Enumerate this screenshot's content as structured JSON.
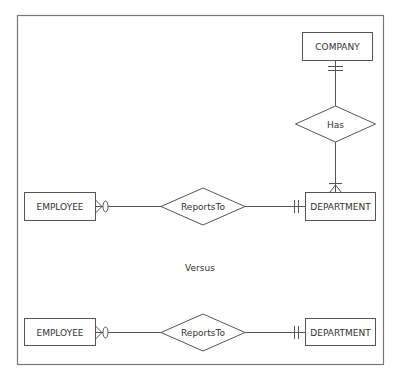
{
  "diagram": {
    "type": "er-diagram",
    "colors": {
      "stroke": "#555555",
      "text": "#333333",
      "background": "#ffffff",
      "frame": "#777777"
    },
    "top": {
      "entities": {
        "company": "COMPANY",
        "employee": "EMPLOYEE",
        "department": "DEPARTMENT"
      },
      "relationships": {
        "has": "Has",
        "reports_to": "ReportsTo"
      },
      "cardinalities": [
        {
          "from": "COMPANY",
          "to": "Has",
          "notation": "one-and-only-one"
        },
        {
          "from": "DEPARTMENT",
          "to": "Has",
          "notation": "one-or-many"
        },
        {
          "from": "EMPLOYEE",
          "to": "ReportsTo",
          "notation": "zero-or-many"
        },
        {
          "from": "DEPARTMENT",
          "to": "ReportsTo",
          "notation": "one-and-only-one"
        }
      ]
    },
    "separator_label": "Versus",
    "bottom": {
      "entities": {
        "employee": "EMPLOYEE",
        "department": "DEPARTMENT"
      },
      "relationships": {
        "reports_to": "ReportsTo"
      },
      "cardinalities": [
        {
          "from": "EMPLOYEE",
          "to": "ReportsTo",
          "notation": "zero-or-many"
        },
        {
          "from": "DEPARTMENT",
          "to": "ReportsTo",
          "notation": "one-and-only-one"
        }
      ]
    }
  }
}
